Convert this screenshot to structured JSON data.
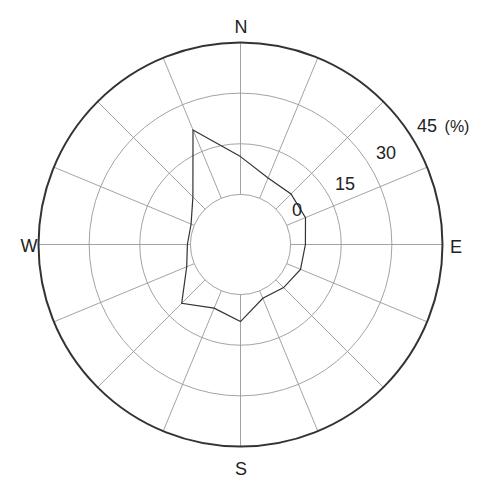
{
  "chart_data": {
    "type": "radar",
    "subtype": "wind-rose",
    "title": "",
    "directions": [
      "N",
      "NNE",
      "NE",
      "ENE",
      "E",
      "ESE",
      "SE",
      "SSE",
      "S",
      "SSW",
      "SW",
      "WSW",
      "W",
      "WNW",
      "NW",
      "NNW"
    ],
    "series": [
      {
        "name": "frequency",
        "unit": "%",
        "values": [
          11.2,
          6.5,
          6.3,
          6.0,
          4.4,
          4.4,
          3.2,
          2.4,
          8.0,
          5.6,
          9.8,
          2.4,
          0.9,
          1.0,
          5.1,
          21.9
        ]
      }
    ],
    "radial_ticks": [
      0,
      15,
      30,
      45
    ],
    "radial_unit_label": "(%)",
    "rlim": [
      0,
      45
    ],
    "zero_ring_offset_fraction": 0.248,
    "spokes": 16,
    "grid": true,
    "cardinal_labels": {
      "N": "N",
      "E": "E",
      "S": "S",
      "W": "W"
    },
    "colors": {
      "line": "#333333",
      "grid": "#999999",
      "outer": "#333333"
    }
  }
}
